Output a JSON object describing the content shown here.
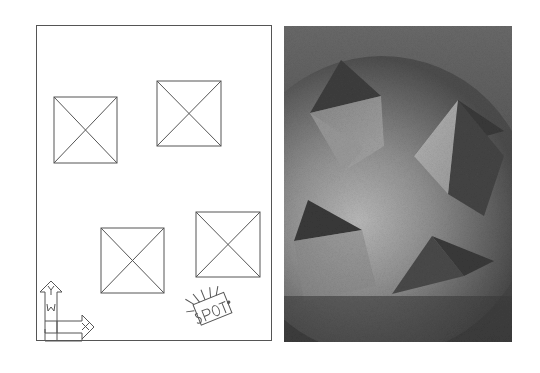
{
  "figure": {
    "left_panel": {
      "name": "plan-view",
      "description": "Top-down wireframe plan of four pyramids and a spotlight",
      "border_color": "#555555",
      "background": "#ffffff",
      "pyramids": [
        {
          "id": 1,
          "x": 17,
          "y": 71,
          "w": 63,
          "h": 66
        },
        {
          "id": 2,
          "x": 120,
          "y": 55,
          "w": 64,
          "h": 65
        },
        {
          "id": 3,
          "x": 64,
          "y": 202,
          "w": 63,
          "h": 65
        },
        {
          "id": 4,
          "x": 159,
          "y": 186,
          "w": 64,
          "h": 65
        }
      ],
      "ucs_icon": {
        "y_label": "Y",
        "w_label": "W",
        "x_label": "X"
      },
      "light": {
        "label": "SPOT"
      }
    },
    "right_panel": {
      "name": "render-view",
      "description": "Rendered perspective of the pyramids lit by a spotlight",
      "background": "#555555",
      "highlight": "#cfcfcf",
      "shadow": "#3a3a3a"
    }
  }
}
